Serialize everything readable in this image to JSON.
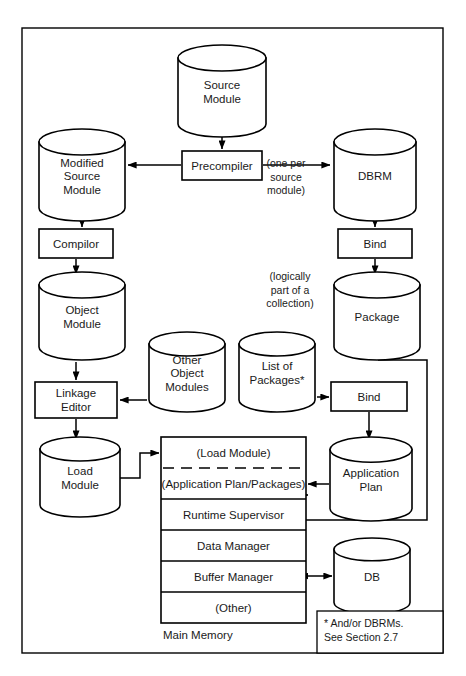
{
  "diagram": {
    "canvas": {
      "width": 466,
      "height": 676
    },
    "frame": {
      "x": 22,
      "y": 28,
      "width": 421,
      "height": 625
    },
    "colors": {
      "stroke": "#000000",
      "fill": "#ffffff",
      "text": "#1a1a1a",
      "background": "#ffffff"
    },
    "nodes": [
      {
        "id": "source-module",
        "shape": "cylinder",
        "lines": [
          "Source",
          "Module"
        ],
        "x": 178,
        "y": 45,
        "width": 88,
        "height": 92
      },
      {
        "id": "precompiler",
        "shape": "box",
        "lines": [
          "Precompiler"
        ],
        "x": 182,
        "y": 151,
        "width": 80,
        "height": 29
      },
      {
        "id": "modified-source-module",
        "shape": "cylinder",
        "lines": [
          "Modified",
          "Source",
          "Module"
        ],
        "x": 39,
        "y": 129,
        "width": 86,
        "height": 92
      },
      {
        "id": "dbrm",
        "shape": "cylinder",
        "lines": [
          "DBRM"
        ],
        "x": 334,
        "y": 129,
        "width": 82,
        "height": 92
      },
      {
        "id": "compiler",
        "shape": "box",
        "lines": [
          "Compilor"
        ],
        "x": 39,
        "y": 229,
        "width": 74,
        "height": 29
      },
      {
        "id": "bind-1",
        "shape": "box",
        "lines": [
          "Bind"
        ],
        "x": 338,
        "y": 229,
        "width": 74,
        "height": 29
      },
      {
        "id": "object-module",
        "shape": "cylinder",
        "lines": [
          "Object",
          "Module"
        ],
        "x": 39,
        "y": 272,
        "width": 86,
        "height": 88
      },
      {
        "id": "package",
        "shape": "cylinder",
        "lines": [
          "Package"
        ],
        "x": 334,
        "y": 272,
        "width": 86,
        "height": 88
      },
      {
        "id": "other-object-modules",
        "shape": "cylinder",
        "lines": [
          "Other",
          "Object",
          "Modules"
        ],
        "x": 149,
        "y": 332,
        "width": 76,
        "height": 80
      },
      {
        "id": "list-of-packages",
        "shape": "cylinder",
        "lines": [
          "List of",
          "Packages*"
        ],
        "x": 239,
        "y": 332,
        "width": 76,
        "height": 80
      },
      {
        "id": "linkage-editor",
        "shape": "box",
        "lines": [
          "Linkage",
          "Editor"
        ],
        "x": 35,
        "y": 382,
        "width": 82,
        "height": 36
      },
      {
        "id": "bind-2",
        "shape": "box",
        "lines": [
          "Bind"
        ],
        "x": 331,
        "y": 382,
        "width": 76,
        "height": 29
      },
      {
        "id": "load-module",
        "shape": "cylinder",
        "lines": [
          "Load",
          "Module"
        ],
        "x": 40,
        "y": 437,
        "width": 80,
        "height": 80
      },
      {
        "id": "application-plan",
        "shape": "cylinder",
        "lines": [
          "Application",
          "Plan"
        ],
        "x": 330,
        "y": 437,
        "width": 82,
        "height": 84
      },
      {
        "id": "db",
        "shape": "cylinder",
        "lines": [
          "DB"
        ],
        "x": 334,
        "y": 538,
        "width": 76,
        "height": 76
      }
    ],
    "main_memory": {
      "box": {
        "x": 161,
        "y": 437,
        "width": 145,
        "height": 186
      },
      "label": "Main Memory",
      "label_x": 163,
      "label_y": 636,
      "rows": [
        {
          "id": "load-module-row",
          "label": "(Load Module)",
          "height": 31,
          "divider_below": "dashed"
        },
        {
          "id": "application-plan-packages-row",
          "label": "(Application Plan/Packages)",
          "height": 31,
          "divider_below": "solid"
        },
        {
          "id": "runtime-supervisor-row",
          "label": "Runtime Supervisor",
          "height": 31,
          "divider_below": "solid"
        },
        {
          "id": "data-manager-row",
          "label": "Data Manager",
          "height": 31,
          "divider_below": "solid"
        },
        {
          "id": "buffer-manager-row",
          "label": "Buffer Manager",
          "height": 31,
          "divider_below": "solid"
        },
        {
          "id": "other-row",
          "label": "(Other)",
          "height": 31,
          "divider_below": "none"
        }
      ]
    },
    "annotations": [
      {
        "id": "one-per-source-module",
        "lines": [
          "(one per",
          "source",
          "module)"
        ],
        "x": 286,
        "y": 178,
        "align": "middle"
      },
      {
        "id": "logically-part-of-a-collection",
        "lines": [
          "(logically",
          "part of a",
          "collection)"
        ],
        "x": 290,
        "y": 291,
        "align": "middle"
      }
    ],
    "footnote": {
      "box": {
        "x": 317,
        "y": 611,
        "width": 126,
        "height": 42
      },
      "lines": [
        "* And/or DBRMs.",
        "See Section 2.7"
      ],
      "x": 324,
      "y": 624
    },
    "connectors": [
      {
        "id": "source-to-precompiler",
        "path": "M222,137 L222,149",
        "arrow_end": true
      },
      {
        "id": "precompiler-to-modified-source",
        "path": "M181,165 L128,165",
        "arrow_end": true
      },
      {
        "id": "precompiler-to-dbrm",
        "path": "M263,165 L330,165",
        "arrow_end": true
      },
      {
        "id": "modified-source-to-compiler",
        "path": "M82,223 L82,227",
        "arrow_end": true
      },
      {
        "id": "dbrm-to-bind1",
        "path": "M375,223 L375,227",
        "arrow_end": true
      },
      {
        "id": "compiler-to-object-module",
        "path": "M76,259 L76,274",
        "arrow_end": true
      },
      {
        "id": "bind1-to-package",
        "path": "M375,259 L375,274",
        "arrow_end": true
      },
      {
        "id": "object-module-to-linkage-editor",
        "path": "M76,362 L76,380",
        "arrow_end": true
      },
      {
        "id": "other-object-modules-to-linkage-editor",
        "path": "M147,400 L120,400",
        "arrow_end": true
      },
      {
        "id": "list-of-packages-to-bind2",
        "path": "M317,397 L329,397",
        "arrow_end": true
      },
      {
        "id": "linkage-editor-to-load-module",
        "path": "M76,419 L76,439",
        "arrow_end": true
      },
      {
        "id": "bind2-to-application-plan",
        "path": "M369,412 L369,439",
        "arrow_end": true
      },
      {
        "id": "load-module-to-main-memory",
        "path": "M120,478 L140,478 L140,453 L159,453",
        "arrow_end": true
      },
      {
        "id": "application-plan-to-plan-row",
        "path": "M329,484 L308,484",
        "arrow_end": true
      },
      {
        "id": "package-to-plan-row",
        "path": "M378,360 L427,360 L427,520 L297,520 L297,495 L308,495",
        "arrow_end": true
      },
      {
        "id": "buffer-manager-to-db",
        "path": "M308,576 L332,576",
        "arrow_end": true,
        "arrow_start": true
      }
    ]
  }
}
